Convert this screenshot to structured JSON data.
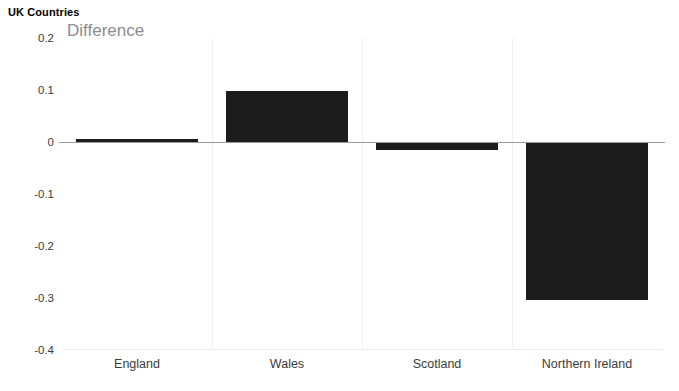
{
  "chart_data": {
    "type": "bar",
    "title": "UK Countries",
    "series_label": "Difference",
    "subtitle": "",
    "xlabel": "",
    "ylabel": "",
    "categories": [
      "England",
      "Wales",
      "Scotland",
      "Northern Ireland"
    ],
    "values": [
      0.006,
      0.099,
      -0.016,
      -0.303
    ],
    "series": [
      {
        "name": "Difference",
        "values": [
          0.006,
          0.099,
          -0.016,
          -0.303
        ]
      }
    ],
    "ylim": [
      -0.4,
      0.2
    ],
    "y_ticks": [
      0.2,
      0.1,
      0,
      -0.1,
      -0.2,
      -0.3,
      -0.4
    ],
    "y_tick_labels": [
      "0.2",
      "0.1",
      "0",
      "-0.1",
      "-0.2",
      "-0.3",
      "-0.4"
    ],
    "grid": false,
    "legend": false,
    "legend_position": "none",
    "bar_color": "#1c1c1c",
    "axis_color": "#9a9a9a",
    "text_color": "#3b3b3b",
    "title_color": "#000000",
    "series_label_color": "#8c8c8c",
    "background": "#ffffff"
  }
}
